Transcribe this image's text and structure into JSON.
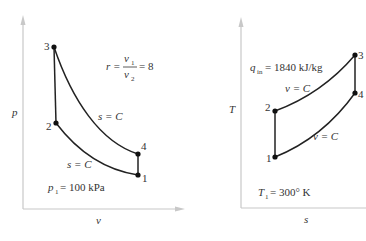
{
  "pv_diagram": {
    "y_axis_label": "p",
    "x_axis_label": "v",
    "points": [
      {
        "id": "1",
        "x": 138,
        "y": 175
      },
      {
        "id": "2",
        "x": 56,
        "y": 123
      },
      {
        "id": "3",
        "x": 54,
        "y": 47
      },
      {
        "id": "4",
        "x": 138,
        "y": 154
      }
    ],
    "curve_labels": {
      "expansion": "s = C",
      "compression": "s = C"
    },
    "ratio_eq": {
      "r": "r =",
      "num": "v",
      "num_sub": "1",
      "den": "v",
      "den_sub": "2",
      "result": "= 8"
    },
    "condition": {
      "var": "p",
      "sub": "1",
      "value": "= 100 kPa"
    }
  },
  "ts_diagram": {
    "y_axis_label": "T",
    "x_axis_label": "s",
    "points": [
      {
        "id": "1",
        "x": 275,
        "y": 157
      },
      {
        "id": "2",
        "x": 275,
        "y": 111
      },
      {
        "id": "3",
        "x": 355,
        "y": 55
      },
      {
        "id": "4",
        "x": 355,
        "y": 93
      }
    ],
    "curve_labels": {
      "heat_add": "v = C",
      "heat_rej": "v = C"
    },
    "heat_in": {
      "var": "q",
      "sub": "in",
      "value": "= 1840 kJ/kg"
    },
    "condition": {
      "var": "T",
      "sub": "1",
      "value": "= 300° K"
    }
  },
  "colors": {
    "axis": "#c8c8c8",
    "curve": "#222222",
    "text": "#333333"
  }
}
